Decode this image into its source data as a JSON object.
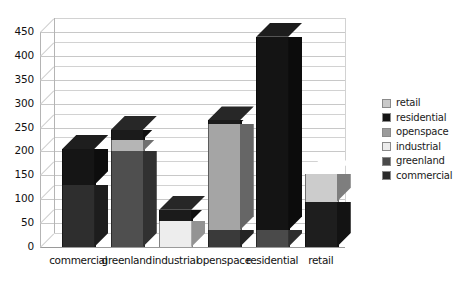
{
  "chart_data": {
    "type": "bar",
    "title": "",
    "subtitle": "",
    "xlabel": "",
    "ylabel": "",
    "stacked": true,
    "three_d": true,
    "grid": true,
    "legend_position": "right",
    "ylim": [
      0,
      450
    ],
    "ytick_step": 50,
    "ytick_labels": [
      "450",
      "400",
      "350",
      "300",
      "250",
      "200",
      "150",
      "100",
      "50",
      "0"
    ],
    "ytick_values": [
      450,
      400,
      350,
      300,
      250,
      200,
      150,
      100,
      50,
      0
    ],
    "categories": [
      "commercial",
      "greenland",
      "industrial",
      "openspace",
      "residential",
      "retail"
    ],
    "series": [
      {
        "name": "commercial",
        "color": "#2b2b2b",
        "values": [
          130,
          0,
          0,
          35,
          0,
          95
        ]
      },
      {
        "name": "greenland",
        "color": "#4a4a4a",
        "values": [
          0,
          200,
          0,
          0,
          35,
          0
        ]
      },
      {
        "name": "industrial",
        "color": "#ececec",
        "values": [
          0,
          0,
          55,
          0,
          0,
          0
        ]
      },
      {
        "name": "openspace",
        "color": "#9b9b9b",
        "values": [
          0,
          25,
          0,
          223,
          0,
          0
        ]
      },
      {
        "name": "residential",
        "color": "#141414",
        "values": [
          75,
          20,
          23,
          7,
          405,
          0
        ]
      },
      {
        "name": "retail",
        "color": "#c9c9c9",
        "values": [
          0,
          0,
          0,
          0,
          0,
          57
        ]
      }
    ],
    "totals": [
      205,
      245,
      78,
      265,
      440,
      152
    ],
    "legend": [
      {
        "label": "retail",
        "color": "#c9c9c9"
      },
      {
        "label": "residential",
        "color": "#141414"
      },
      {
        "label": "openspace",
        "color": "#9b9b9b"
      },
      {
        "label": "industrial",
        "color": "#ececec"
      },
      {
        "label": "greenland",
        "color": "#4a4a4a"
      },
      {
        "label": "commercial",
        "color": "#2b2b2b"
      }
    ],
    "bars": [
      {
        "category": "commercial",
        "total": 205,
        "segments": [
          {
            "series": "commercial",
            "from": 0,
            "to": 130,
            "color": "#2e2e2e"
          },
          {
            "series": "residential",
            "from": 130,
            "to": 205,
            "color": "#151515"
          }
        ]
      },
      {
        "category": "greenland",
        "total": 245,
        "segments": [
          {
            "series": "greenland",
            "from": 0,
            "to": 200,
            "color": "#4f4f4f"
          },
          {
            "series": "openspace",
            "from": 200,
            "to": 225,
            "color": "#b5b5b5"
          },
          {
            "series": "residential",
            "from": 225,
            "to": 245,
            "color": "#1b1b1b"
          }
        ]
      },
      {
        "category": "industrial",
        "total": 78,
        "segments": [
          {
            "series": "industrial",
            "from": 0,
            "to": 55,
            "color": "#ededed"
          },
          {
            "series": "residential",
            "from": 55,
            "to": 78,
            "color": "#1b1b1b"
          }
        ]
      },
      {
        "category": "openspace",
        "total": 265,
        "segments": [
          {
            "series": "commercial",
            "from": 0,
            "to": 35,
            "color": "#3a3a3a"
          },
          {
            "series": "openspace",
            "from": 35,
            "to": 258,
            "color": "#a5a5a5"
          },
          {
            "series": "residential",
            "from": 258,
            "to": 265,
            "color": "#1b1b1b"
          }
        ]
      },
      {
        "category": "residential",
        "total": 440,
        "segments": [
          {
            "series": "greenland",
            "from": 0,
            "to": 35,
            "color": "#4a4a4a"
          },
          {
            "series": "residential",
            "from": 35,
            "to": 440,
            "color": "#141414"
          }
        ]
      },
      {
        "category": "retail",
        "total": 152,
        "segments": [
          {
            "series": "commercial",
            "from": 0,
            "to": 95,
            "color": "#1e1e1e"
          },
          {
            "series": "retail",
            "from": 95,
            "to": 152,
            "color": "#cccccc"
          }
        ]
      }
    ]
  }
}
